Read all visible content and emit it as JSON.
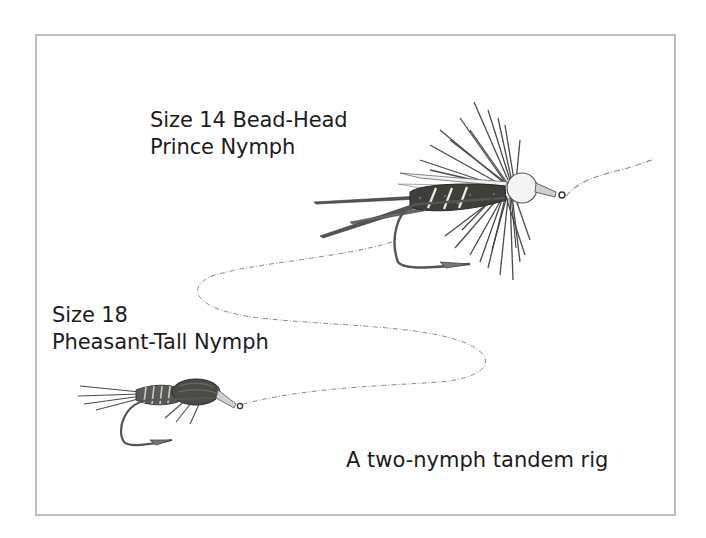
{
  "diagram": {
    "title": "A two-nymph tandem rig",
    "frame_color": "#bdbdbd",
    "flies": [
      {
        "id": "upper-fly",
        "label_line1": "Size 14 Bead-Head",
        "label_line2": "Prince Nymph",
        "icon": "prince-nymph-icon"
      },
      {
        "id": "lower-fly",
        "label_line1": "Size 18",
        "label_line2": "Pheasant-Tall Nymph",
        "icon": "pheasant-tail-nymph-icon"
      }
    ],
    "tippet": {
      "icon": "tippet-line-icon",
      "color": "#8a8a8a"
    }
  }
}
